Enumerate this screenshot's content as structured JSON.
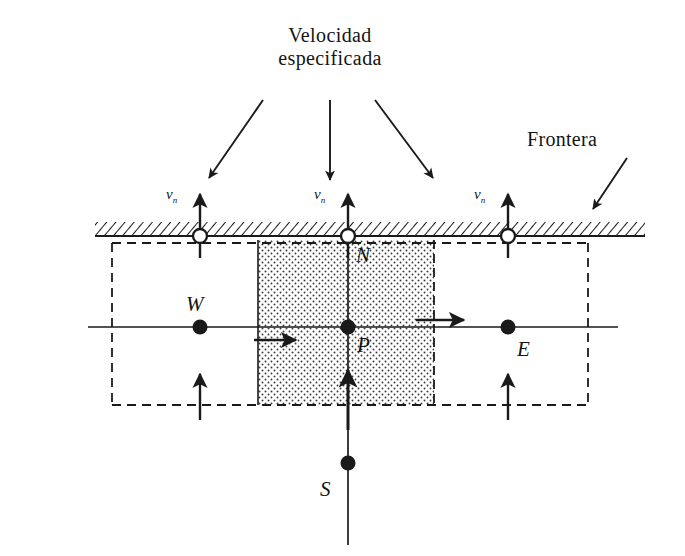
{
  "figure": {
    "width": 685,
    "height": 556,
    "background": "#ffffff",
    "ink": "#1a1a1a"
  },
  "annotations": {
    "title_line1": "Velocidad",
    "title_line2": "especificada",
    "boundary_label": "Frontera"
  },
  "velocity_labels": [
    {
      "symbol": "v",
      "subscript": "n",
      "x": 168,
      "y": 188
    },
    {
      "symbol": "v",
      "subscript": "n",
      "x": 316,
      "y": 188
    },
    {
      "symbol": "v",
      "subscript": "n",
      "x": 476,
      "y": 188
    }
  ],
  "node_labels": [
    {
      "name": "W",
      "text": "W",
      "x": 190,
      "y": 296
    },
    {
      "name": "N",
      "text": "N",
      "x": 355,
      "y": 250
    },
    {
      "name": "P",
      "text": "P",
      "x": 355,
      "y": 334
    },
    {
      "name": "E",
      "text": "E",
      "x": 516,
      "y": 337
    },
    {
      "name": "S",
      "text": "S",
      "x": 320,
      "y": 482
    }
  ],
  "geometry": {
    "boundary_line": {
      "x1": 95,
      "x2": 645,
      "y": 236,
      "hatch_height": 13
    },
    "horizontal_center_line": {
      "x1": 88,
      "x2": 618,
      "y": 327
    },
    "vertical_center_line": {
      "x": 348,
      "y1": 236,
      "y2": 545
    },
    "dashed_rect": {
      "x": 112,
      "y": 243,
      "width": 476,
      "height": 162
    },
    "control_volume": {
      "x": 258,
      "y": 243,
      "width": 176,
      "height": 162,
      "fill": "stipple"
    }
  },
  "markers": {
    "open_circles": [
      {
        "cx": 200,
        "cy": 236,
        "r": 7
      },
      {
        "cx": 348,
        "cy": 236,
        "r": 7
      },
      {
        "cx": 508,
        "cy": 236,
        "r": 7
      }
    ],
    "filled_dots": [
      {
        "name": "W",
        "cx": 200,
        "cy": 327,
        "r": 7
      },
      {
        "name": "P",
        "cx": 348,
        "cy": 327,
        "r": 7
      },
      {
        "name": "E",
        "cx": 508,
        "cy": 327,
        "r": 7
      },
      {
        "name": "S",
        "cx": 348,
        "cy": 463,
        "r": 7
      }
    ]
  },
  "arrows": {
    "callout_left": {
      "x1": 262,
      "y1": 100,
      "x2": 210,
      "y2": 175
    },
    "callout_center": {
      "x1": 330,
      "y1": 100,
      "x2": 330,
      "y2": 178
    },
    "callout_right": {
      "x1": 375,
      "y1": 100,
      "x2": 432,
      "y2": 175
    },
    "frontera": {
      "x1": 625,
      "y1": 160,
      "x2": 592,
      "y2": 208
    },
    "boundary_flux": [
      {
        "x": 200,
        "y1": 257,
        "y2": 192
      },
      {
        "x": 348,
        "y1": 257,
        "y2": 192
      },
      {
        "x": 508,
        "y1": 257,
        "y2": 192
      }
    ],
    "bottom_flux": [
      {
        "x": 200,
        "y1": 420,
        "y2": 372
      },
      {
        "x": 348,
        "y1": 428,
        "y2": 368
      },
      {
        "x": 508,
        "y1": 420,
        "y2": 372
      }
    ],
    "horizontal_flux": [
      {
        "y": 340,
        "x1": 255,
        "x2": 295
      },
      {
        "y": 320,
        "x1": 418,
        "x2": 462
      }
    ]
  }
}
